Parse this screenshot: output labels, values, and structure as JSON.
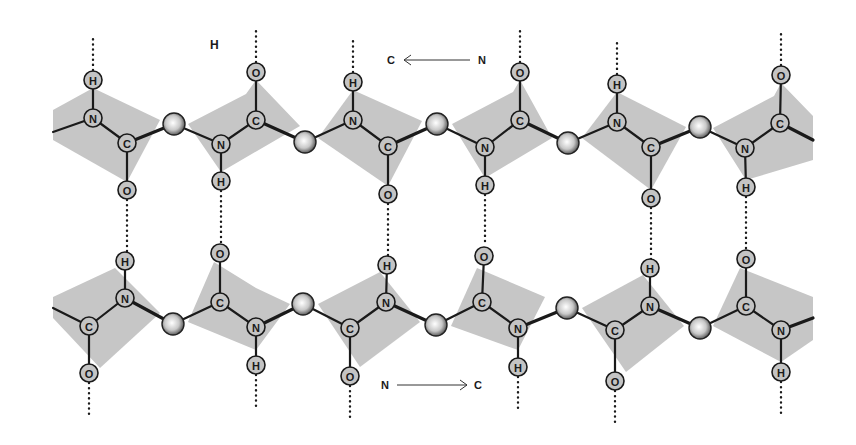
{
  "figure": {
    "type": "antiparallel beta-sheet (two polypeptide strands with hydrogen bonds)",
    "stray_label": "H",
    "top_strand": {
      "direction": {
        "from": "N",
        "to": "C",
        "arrow": "right-to-left",
        "label_left": "C",
        "label_right": "N"
      },
      "backbone": [
        {
          "type": "bond_stub",
          "x": 53,
          "y": 132
        },
        {
          "atom": "N",
          "x": 93,
          "y": 118
        },
        {
          "atom": "C",
          "x": 127,
          "y": 143
        },
        {
          "atom": "Calpha",
          "x": 174,
          "y": 124
        },
        {
          "atom": "N",
          "x": 221,
          "y": 144
        },
        {
          "atom": "C",
          "x": 256,
          "y": 120
        },
        {
          "atom": "Calpha",
          "x": 305,
          "y": 142
        },
        {
          "atom": "N",
          "x": 353,
          "y": 120
        },
        {
          "atom": "C",
          "x": 388,
          "y": 146
        },
        {
          "atom": "Calpha",
          "x": 437,
          "y": 124
        },
        {
          "atom": "N",
          "x": 485,
          "y": 147
        },
        {
          "atom": "C",
          "x": 520,
          "y": 120
        },
        {
          "atom": "Calpha",
          "x": 568,
          "y": 143
        },
        {
          "atom": "N",
          "x": 617,
          "y": 122
        },
        {
          "atom": "C",
          "x": 651,
          "y": 147
        },
        {
          "atom": "Calpha",
          "x": 700,
          "y": 127
        },
        {
          "atom": "N",
          "x": 745,
          "y": 148
        },
        {
          "atom": "C",
          "x": 780,
          "y": 123
        },
        {
          "type": "bond_stub",
          "x": 813,
          "y": 140
        }
      ],
      "side_atoms": [
        {
          "atom": "H",
          "x": 93,
          "y": 80,
          "bonded_to": "N",
          "hbond_up": true
        },
        {
          "atom": "O",
          "x": 127,
          "y": 190,
          "bonded_to": "C",
          "hbond_down": true
        },
        {
          "atom": "H",
          "x": 221,
          "y": 181,
          "bonded_to": "N",
          "hbond_down": true
        },
        {
          "atom": "O",
          "x": 256,
          "y": 72,
          "bonded_to": "C",
          "hbond_up": true
        },
        {
          "atom": "H",
          "x": 353,
          "y": 82,
          "bonded_to": "N",
          "hbond_up": true
        },
        {
          "atom": "O",
          "x": 388,
          "y": 194,
          "bonded_to": "C",
          "hbond_down": true
        },
        {
          "atom": "H",
          "x": 485,
          "y": 185,
          "bonded_to": "N",
          "hbond_down": true
        },
        {
          "atom": "O",
          "x": 520,
          "y": 72,
          "bonded_to": "C",
          "hbond_up": true
        },
        {
          "atom": "H",
          "x": 617,
          "y": 84,
          "bonded_to": "N",
          "hbond_up": true
        },
        {
          "atom": "O",
          "x": 651,
          "y": 198,
          "bonded_to": "C",
          "hbond_down": true
        },
        {
          "atom": "H",
          "x": 746,
          "y": 187,
          "bonded_to": "N",
          "hbond_down": true
        },
        {
          "atom": "O",
          "x": 781,
          "y": 75,
          "bonded_to": "C",
          "hbond_up": true
        }
      ],
      "planes": [
        "53,110 93,88 160,120 127,182 53,140",
        "188,124 246,94 256,80 300,126 221,172",
        "318,138 353,90 422,121 388,186",
        "452,124 513,92 520,80 552,138 485,178",
        "582,138 617,92 686,127 651,190",
        "713,128 774,96 781,83 813,116 813,160 746,180"
      ]
    },
    "bottom_strand": {
      "direction": {
        "from": "N",
        "to": "C",
        "arrow": "left-to-right",
        "label_left": "N",
        "label_right": "C"
      },
      "backbone": [
        {
          "type": "bond_stub",
          "x": 53,
          "y": 308
        },
        {
          "atom": "C",
          "x": 89,
          "y": 326
        },
        {
          "atom": "N",
          "x": 125,
          "y": 298
        },
        {
          "atom": "Calpha",
          "x": 173,
          "y": 324
        },
        {
          "atom": "C",
          "x": 220,
          "y": 302
        },
        {
          "atom": "N",
          "x": 256,
          "y": 327
        },
        {
          "atom": "Calpha",
          "x": 303,
          "y": 304
        },
        {
          "atom": "C",
          "x": 350,
          "y": 328
        },
        {
          "atom": "N",
          "x": 386,
          "y": 302
        },
        {
          "atom": "Calpha",
          "x": 436,
          "y": 325
        },
        {
          "atom": "C",
          "x": 482,
          "y": 302
        },
        {
          "atom": "N",
          "x": 518,
          "y": 328
        },
        {
          "atom": "Calpha",
          "x": 567,
          "y": 308
        },
        {
          "atom": "C",
          "x": 615,
          "y": 330
        },
        {
          "atom": "N",
          "x": 650,
          "y": 306
        },
        {
          "atom": "Calpha",
          "x": 700,
          "y": 328
        },
        {
          "atom": "C",
          "x": 746,
          "y": 306
        },
        {
          "atom": "N",
          "x": 781,
          "y": 330
        },
        {
          "type": "bond_stub",
          "x": 813,
          "y": 318
        }
      ],
      "side_atoms": [
        {
          "atom": "H",
          "x": 125,
          "y": 261,
          "bonded_to": "N",
          "hbond_up": true
        },
        {
          "atom": "O",
          "x": 89,
          "y": 373,
          "bonded_to": "C",
          "hbond_down": true
        },
        {
          "atom": "O",
          "x": 220,
          "y": 253,
          "bonded_to": "C",
          "hbond_up": true
        },
        {
          "atom": "H",
          "x": 256,
          "y": 365,
          "bonded_to": "N",
          "hbond_down": true
        },
        {
          "atom": "H",
          "x": 387,
          "y": 265,
          "bonded_to": "N",
          "hbond_up": true
        },
        {
          "atom": "O",
          "x": 350,
          "y": 376,
          "bonded_to": "C",
          "hbond_down": true
        },
        {
          "atom": "O",
          "x": 484,
          "y": 256,
          "bonded_to": "C",
          "hbond_up": true
        },
        {
          "atom": "H",
          "x": 518,
          "y": 367,
          "bonded_to": "N",
          "hbond_down": true
        },
        {
          "atom": "H",
          "x": 650,
          "y": 268,
          "bonded_to": "N",
          "hbond_up": true
        },
        {
          "atom": "O",
          "x": 615,
          "y": 381,
          "bonded_to": "C",
          "hbond_down": true
        },
        {
          "atom": "O",
          "x": 746,
          "y": 259,
          "bonded_to": "C",
          "hbond_up": true
        },
        {
          "atom": "H",
          "x": 781,
          "y": 372,
          "bonded_to": "N",
          "hbond_down": true
        }
      ],
      "planes": [
        "53,297 115,268 160,313 100,368 53,318",
        "188,322 214,262 256,288 290,304 256,350",
        "318,304 380,272 420,322 360,367",
        "451,326 477,268 545,297 518,350",
        "582,308 643,275 684,326 626,372",
        "713,326 740,268 813,297 813,340 781,362"
      ]
    },
    "hydrogen_bonds": [
      {
        "x": 127,
        "y1": 200,
        "y2": 252
      },
      {
        "x": 221,
        "y1": 191,
        "y2": 243
      },
      {
        "x": 388,
        "y1": 204,
        "y2": 256
      },
      {
        "x": 485,
        "y1": 195,
        "y2": 246
      },
      {
        "x": 651,
        "y1": 208,
        "y2": 259
      },
      {
        "x": 746,
        "y1": 197,
        "y2": 250
      }
    ],
    "colors": {
      "plane_fill": "#c6c6c6",
      "atom_fill": "#c4c4c4",
      "bond": "#1a1a1a",
      "background": "#ffffff"
    }
  }
}
